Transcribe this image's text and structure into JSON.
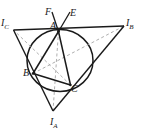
{
  "figure": {
    "kind": "geometry-diagram",
    "width": 143,
    "height": 134,
    "background": "#ffffff",
    "colors": {
      "stroke_dark": "#1a1a1a",
      "stroke_medium": "#3a3a3a",
      "stroke_dashed": "#9a9a9a",
      "label": "#1a1a1a"
    },
    "labels": {
      "I_C": {
        "base": "I",
        "sub": "C",
        "x": 1,
        "y": 18
      },
      "I_B": {
        "base": "I",
        "sub": "B",
        "x": 126,
        "y": 18
      },
      "I_A": {
        "base": "I",
        "sub": "A",
        "x": 50,
        "y": 117
      },
      "A": {
        "base": "A",
        "sub": "",
        "x": 50,
        "y": 21
      },
      "B": {
        "base": "B",
        "sub": "",
        "x": 23,
        "y": 68
      },
      "C": {
        "base": "C",
        "sub": "",
        "x": 71,
        "y": 84
      },
      "E": {
        "base": "E",
        "sub": "",
        "x": 70,
        "y": 8
      },
      "F": {
        "base": "F",
        "sub": "",
        "x": 45,
        "y": 7
      }
    },
    "points": {
      "A": {
        "x": 58.5,
        "y": 31.5
      },
      "B": {
        "x": 33.0,
        "y": 73.5
      },
      "C": {
        "x": 70.5,
        "y": 85.0
      },
      "I_A": {
        "x": 53.0,
        "y": 111.0
      },
      "I_B": {
        "x": 124.0,
        "y": 26.0
      },
      "I_C": {
        "x": 13.5,
        "y": 30.0
      },
      "E_end": {
        "x": 70.0,
        "y": 13.0
      },
      "F_end": {
        "x": 52.0,
        "y": 13.0
      }
    },
    "circumcircle": {
      "cx": 60.0,
      "cy": 60.5,
      "rx": 33.0,
      "ry": 31.0
    },
    "segments": [
      {
        "name": "excentral-side-Ic-Ib",
        "from": "I_C",
        "to": "I_B",
        "style": "solid"
      },
      {
        "name": "excentral-side-Ic-Ia",
        "from": "I_C",
        "to": "I_A",
        "style": "solid"
      },
      {
        "name": "excentral-side-Ib-Ia",
        "from": "I_B",
        "to": "I_A",
        "style": "solid"
      },
      {
        "name": "triangle-side-AB",
        "from": "A",
        "to": "B",
        "style": "solid"
      },
      {
        "name": "triangle-side-BC",
        "from": "B",
        "to": "C",
        "style": "solid"
      },
      {
        "name": "triangle-side-CA",
        "from": "C",
        "to": "A",
        "style": "solid"
      },
      {
        "name": "bisector-A-Ia",
        "from": "A",
        "to": "I_A",
        "style": "dashed"
      },
      {
        "name": "bisector-B-Ib",
        "from": "B",
        "to": "I_B",
        "style": "dashed"
      },
      {
        "name": "bisector-C-Ic",
        "from": "C",
        "to": "I_C",
        "style": "dashed"
      },
      {
        "name": "ray-A-F",
        "from": "A",
        "to": "F_end",
        "style": "solid"
      },
      {
        "name": "ray-A-E",
        "from": "A",
        "to": "E_end",
        "style": "solid"
      }
    ]
  }
}
